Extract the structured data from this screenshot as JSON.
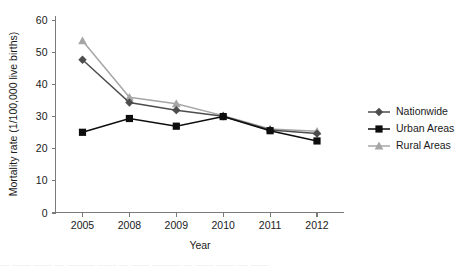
{
  "chart_data": {
    "type": "line",
    "title": "",
    "xlabel": "Year",
    "ylabel": "Mortality rate (1/100,000 live births)",
    "categories": [
      "2005",
      "2008",
      "2009",
      "2010",
      "2011",
      "2012"
    ],
    "ylim": [
      0,
      60
    ],
    "yticks": [
      0,
      10,
      20,
      30,
      40,
      50,
      60
    ],
    "grid": false,
    "legend_position": "right",
    "series": [
      {
        "name": "Nationwide",
        "marker": "diamond",
        "color": "#4d4d4d",
        "values": [
          47.6,
          34.3,
          31.9,
          30.0,
          25.7,
          24.6
        ]
      },
      {
        "name": "Urban Areas",
        "marker": "square",
        "color": "#0d0d0d",
        "values": [
          25.0,
          29.3,
          26.9,
          29.9,
          25.5,
          22.3
        ]
      },
      {
        "name": "Rural Areas",
        "marker": "triangle",
        "color": "#a6a6a6",
        "values": [
          53.5,
          35.9,
          33.9,
          30.2,
          26.0,
          25.3
        ]
      }
    ]
  },
  "footer": {
    "smudge_text": "—  ——   ——  —   ———  ——    —  ——   ———   —  ——  ——   —    ——"
  }
}
